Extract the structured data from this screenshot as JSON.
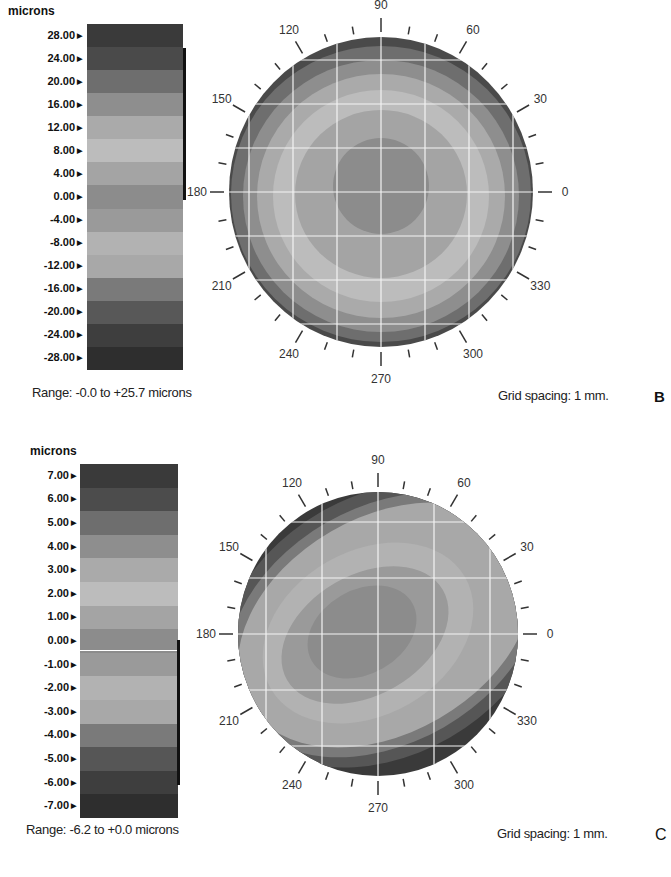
{
  "panels": [
    {
      "id": "B",
      "units_label": "microns",
      "scale_ticks": [
        "28.00",
        "24.00",
        "20.00",
        "16.00",
        "12.00",
        "8.00",
        "4.00",
        "0.00",
        "-4.00",
        "-8.00",
        "-12.00",
        "-16.00",
        "-20.00",
        "-24.00",
        "-28.00"
      ],
      "scale_colors": [
        "#3a3a3a",
        "#4a4a4a",
        "#6e6e6e",
        "#8e8e8e",
        "#aaaaaa",
        "#bcbcbc",
        "#a4a4a4",
        "#8c8c8c",
        "#9a9a9a",
        "#b2b2b2",
        "#a8a8a8",
        "#7a7a7a",
        "#585858",
        "#3e3e3e",
        "#2e2e2e"
      ],
      "range_text": "Range: -0.0 to +25.7 microns",
      "grid_text": "Grid spacing: 1 mm.",
      "letter": "B",
      "angle_labels": [
        "0",
        "30",
        "60",
        "90",
        "120",
        "150",
        "180",
        "210",
        "240",
        "270",
        "300",
        "330"
      ]
    },
    {
      "id": "C",
      "units_label": "microns",
      "scale_ticks": [
        "7.00",
        "6.00",
        "5.00",
        "4.00",
        "3.00",
        "2.00",
        "1.00",
        "0.00",
        "-1.00",
        "-2.00",
        "-3.00",
        "-4.00",
        "-5.00",
        "-6.00",
        "-7.00"
      ],
      "scale_colors": [
        "#3a3a3a",
        "#4c4c4c",
        "#6e6e6e",
        "#8e8e8e",
        "#aaaaaa",
        "#bcbcbc",
        "#a4a4a4",
        "#8c8c8c",
        "#9a9a9a",
        "#b2b2b2",
        "#a8a8a8",
        "#7a7a7a",
        "#565656",
        "#3e3e3e",
        "#2e2e2e"
      ],
      "range_text": "Range: -6.2 to +0.0 microns",
      "grid_text": "Grid spacing: 1 mm.",
      "letter": "C",
      "angle_labels": [
        "0",
        "30",
        "60",
        "90",
        "120",
        "150",
        "180",
        "210",
        "240",
        "270",
        "300",
        "330"
      ]
    }
  ],
  "chart_data": [
    {
      "type": "heatmap",
      "title": "Corneal elevation map B",
      "legend_title": "microns",
      "legend_ticks": [
        28,
        24,
        20,
        16,
        12,
        8,
        4,
        0,
        -4,
        -8,
        -12,
        -16,
        -20,
        -24,
        -28
      ],
      "range": [
        -0.0,
        25.7
      ],
      "range_label": "Range: -0.0 to +25.7 microns",
      "grid_spacing": "1 mm",
      "polar_axis_labels_deg": [
        0,
        30,
        60,
        90,
        120,
        150,
        180,
        210,
        240,
        270,
        300,
        330
      ],
      "pattern": "concentric rings, lowest at center, rising toward periphery",
      "grid": true
    },
    {
      "type": "heatmap",
      "title": "Corneal elevation map C",
      "legend_title": "microns",
      "legend_ticks": [
        7,
        6,
        5,
        4,
        3,
        2,
        1,
        0,
        -1,
        -2,
        -3,
        -4,
        -5,
        -6,
        -7
      ],
      "range": [
        -6.2,
        0.0
      ],
      "range_label": "Range: -6.2 to +0.0 microns",
      "grid_spacing": "1 mm",
      "polar_axis_labels_deg": [
        0,
        30,
        60,
        90,
        120,
        150,
        180,
        210,
        240,
        270,
        300,
        330
      ],
      "pattern": "oblique elliptical contours tilted along ~30°/210° axis, deepest near center",
      "grid": true
    }
  ]
}
